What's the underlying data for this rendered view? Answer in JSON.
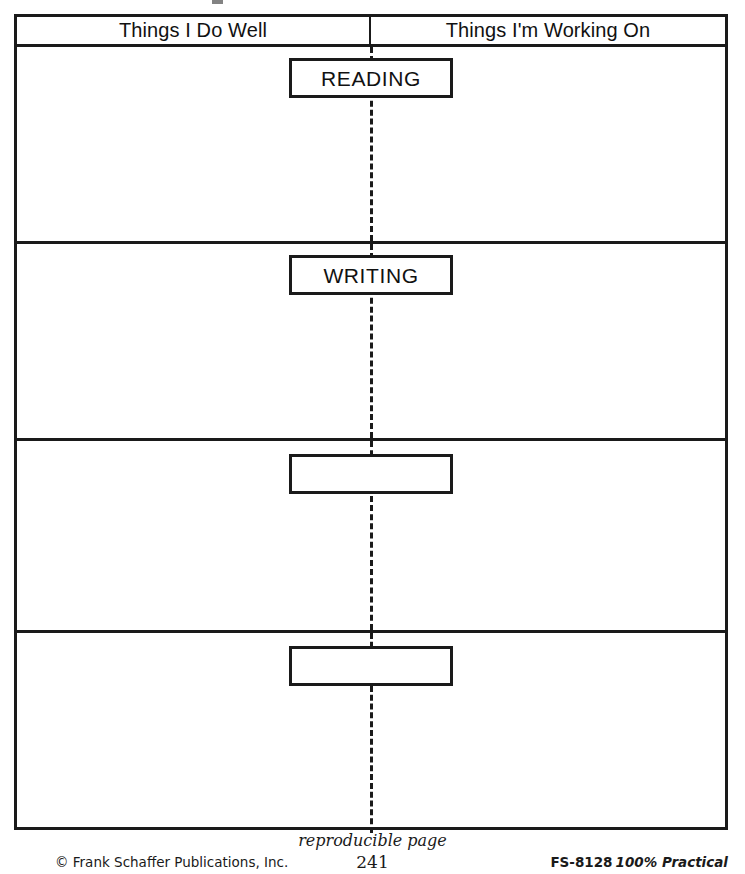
{
  "worksheet": {
    "columns": [
      {
        "label": "Things I Do Well"
      },
      {
        "label": "Things I'm Working On"
      }
    ],
    "rows": [
      {
        "topic": "READING"
      },
      {
        "topic": "WRITING"
      },
      {
        "topic": ""
      },
      {
        "topic": ""
      }
    ]
  },
  "footer": {
    "reproducible": "reproducible page",
    "page_number": "241",
    "copyright": "© Frank Schaffer Publications, Inc.",
    "catalog_code": "FS-8128",
    "product_name": "100% Practical"
  },
  "colors": {
    "ink": "#1a1a1a",
    "paper": "#ffffff"
  }
}
